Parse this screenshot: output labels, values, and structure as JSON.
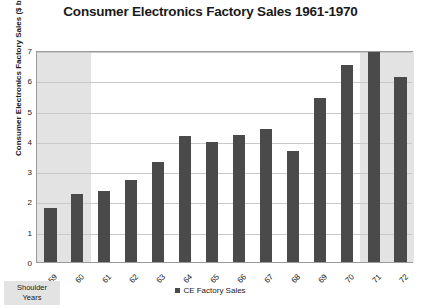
{
  "chart_data": {
    "type": "bar",
    "title": "Consumer Electronics Factory Sales 1961-1970",
    "xlabel": "",
    "ylabel": "Consumer Electronics Factory Sales ($ billion)",
    "categories": [
      "59",
      "60",
      "61",
      "62",
      "63",
      "64",
      "65",
      "66",
      "67",
      "68",
      "69",
      "70",
      "71",
      "72"
    ],
    "values": [
      1.8,
      2.25,
      2.35,
      2.7,
      3.3,
      4.15,
      3.95,
      4.2,
      4.4,
      3.65,
      5.4,
      6.5,
      6.95,
      6.1
    ],
    "series": [
      {
        "name": "CE Factory Sales",
        "values": [
          1.8,
          2.25,
          2.35,
          2.7,
          3.3,
          4.15,
          3.95,
          4.2,
          4.4,
          3.65,
          5.4,
          6.5,
          6.95,
          6.1
        ]
      }
    ],
    "ylim": [
      0,
      7
    ],
    "yticks": [
      0,
      1,
      2,
      3,
      4,
      5,
      6,
      7
    ],
    "ytick_labels": [
      "0",
      "1",
      "2",
      "3",
      "4",
      "5",
      "6",
      "7"
    ],
    "grid": true,
    "legend_position": "bottom",
    "legend": [
      "CE Factory Sales"
    ],
    "annotations": [
      {
        "name": "shoulder-years",
        "text_line1": "Shoulder",
        "text_line2": "Years",
        "shaded_categories_left": [
          "59",
          "60"
        ],
        "shaded_categories_right": [
          "71",
          "72"
        ]
      }
    ],
    "colors": {
      "bar": "#4a4a4a",
      "shade_band": "#e3e3e3",
      "gridline": "#c9c9c9",
      "plot_border": "#9a9a9a",
      "background": "#ffffff",
      "text": "#1a1a1a"
    }
  }
}
